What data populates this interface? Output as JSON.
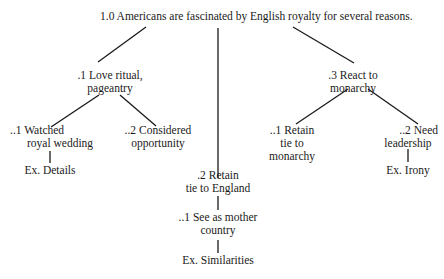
{
  "diagram": {
    "type": "tree-outline",
    "root": {
      "id": "1.0",
      "lines": [
        "1.0 Americans are fascinated by English royalty for several reasons."
      ]
    },
    "branches": [
      {
        "id": ".1",
        "lines": [
          ".1 Love ritual,",
          "pageantry"
        ],
        "children": [
          {
            "id": "..1",
            "lines": [
              "..1 Watched",
              "royal wedding"
            ],
            "example": "Ex. Details"
          },
          {
            "id": "..2",
            "lines": [
              "..2 Considered",
              "opportunity"
            ]
          }
        ]
      },
      {
        "id": ".2",
        "lines": [
          ".2 Retain",
          "tie to England"
        ],
        "children": [
          {
            "id": "..1",
            "lines": [
              "..1 See as mother",
              "country"
            ],
            "example": "Ex. Similarities"
          }
        ]
      },
      {
        "id": ".3",
        "lines": [
          ".3 React to",
          "monarchy"
        ],
        "children": [
          {
            "id": "..1",
            "lines": [
              "..1 Retain",
              "tie to",
              "monarchy"
            ]
          },
          {
            "id": "..2",
            "lines": [
              "..2 Need",
              "leadership"
            ],
            "example": "Ex. Irony"
          }
        ]
      }
    ]
  }
}
